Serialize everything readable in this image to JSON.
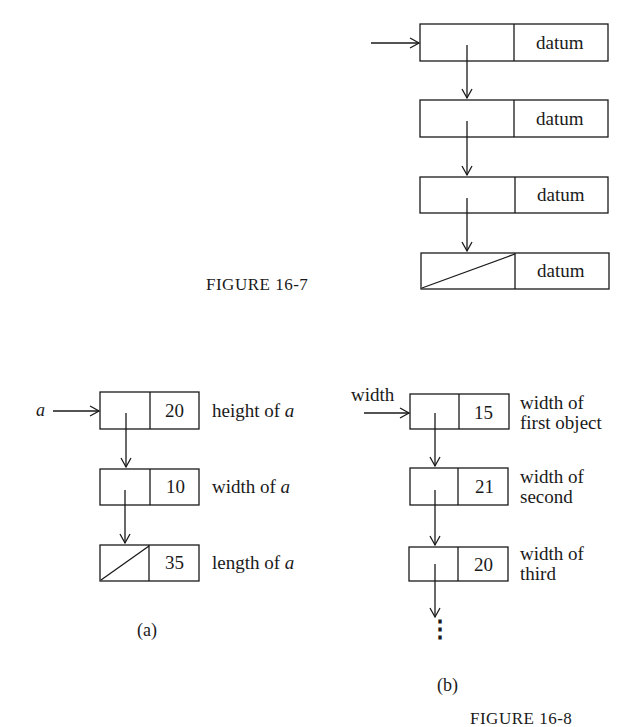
{
  "figure_16_7": {
    "caption": "FIGURE 16-7",
    "nodes": [
      {
        "datum": "datum",
        "null_pointer": false
      },
      {
        "datum": "datum",
        "null_pointer": false
      },
      {
        "datum": "datum",
        "null_pointer": false
      },
      {
        "datum": "datum",
        "null_pointer": true
      }
    ]
  },
  "figure_16_8": {
    "caption": "FIGURE 16-8",
    "part_a": {
      "label": "(a)",
      "head_pointer": "a",
      "nodes": [
        {
          "value": "20",
          "desc_prefix": "height of ",
          "desc_var": "a",
          "null_pointer": false
        },
        {
          "value": "10",
          "desc_prefix": "width of ",
          "desc_var": "a",
          "null_pointer": false
        },
        {
          "value": "35",
          "desc_prefix": "length of ",
          "desc_var": "a",
          "null_pointer": true
        }
      ]
    },
    "part_b": {
      "label": "(b)",
      "head_pointer": "width",
      "nodes": [
        {
          "value": "15",
          "desc_line1": "width of",
          "desc_line2": "first object"
        },
        {
          "value": "21",
          "desc_line1": "width of",
          "desc_line2": "second"
        },
        {
          "value": "20",
          "desc_line1": "width of",
          "desc_line2": "third"
        }
      ],
      "continuation": "⋮"
    }
  }
}
